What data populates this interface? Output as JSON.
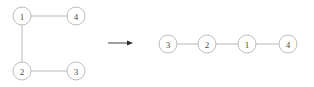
{
  "figure": {
    "background_color": "#ffffff",
    "node_stroke_color": "#bdbdbd",
    "node_fill_color": "#ffffff",
    "edge_color": "#b9b9b9",
    "label_color": "#4a4a4a",
    "arrow_color": "#2e2e2e",
    "node_radius": 9
  },
  "left_graph": {
    "name": "original-graph",
    "nodes": [
      {
        "id": "n1",
        "label": "1",
        "cx": 22,
        "cy": 16
      },
      {
        "id": "n4",
        "label": "4",
        "cx": 76,
        "cy": 16
      },
      {
        "id": "n2",
        "label": "2",
        "cx": 22,
        "cy": 71
      },
      {
        "id": "n3",
        "label": "3",
        "cx": 76,
        "cy": 71
      }
    ],
    "edges": [
      {
        "id": "e14",
        "from": "1",
        "to": "4",
        "x1": 31,
        "y1": 16,
        "x2": 67,
        "y2": 16
      },
      {
        "id": "e12",
        "from": "1",
        "to": "2",
        "x1": 22,
        "y1": 25,
        "x2": 22,
        "y2": 62
      },
      {
        "id": "e23",
        "from": "2",
        "to": "3",
        "x1": 31,
        "y1": 71,
        "x2": 67,
        "y2": 71
      }
    ]
  },
  "arrow": {
    "name": "transformation-arrow",
    "label": "→",
    "x1": 108,
    "y1": 43,
    "x2": 133,
    "y2": 43
  },
  "right_graph": {
    "name": "transformed-graph",
    "nodes": [
      {
        "id": "m3",
        "label": "3",
        "cx": 168,
        "cy": 44
      },
      {
        "id": "m2",
        "label": "2",
        "cx": 207,
        "cy": 44
      },
      {
        "id": "m1",
        "label": "1",
        "cx": 247,
        "cy": 44
      },
      {
        "id": "m4",
        "label": "4",
        "cx": 288,
        "cy": 44
      }
    ],
    "edges": [
      {
        "id": "f32",
        "from": "3",
        "to": "2",
        "x1": 177,
        "y1": 44,
        "x2": 198,
        "y2": 44
      },
      {
        "id": "f21",
        "from": "2",
        "to": "1",
        "x1": 216,
        "y1": 44,
        "x2": 238,
        "y2": 44
      },
      {
        "id": "f14",
        "from": "1",
        "to": "4",
        "x1": 256,
        "y1": 44,
        "x2": 279,
        "y2": 44
      }
    ]
  }
}
